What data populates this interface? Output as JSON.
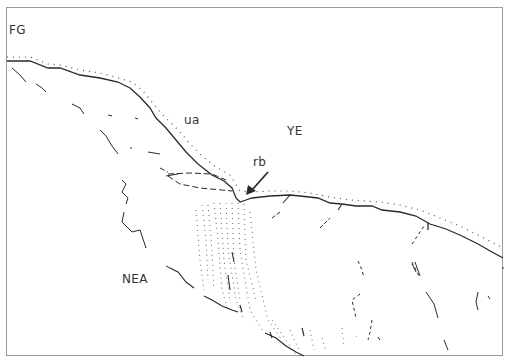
{
  "diagram": {
    "labels": {
      "fg": "FG",
      "ua": "ua",
      "ye": "YE",
      "rb": "rb",
      "nea": "NEA"
    },
    "colors": {
      "line": "#2a2a2a",
      "dots": "#555555",
      "border": "#9a9a9a",
      "background": "#ffffff"
    }
  }
}
